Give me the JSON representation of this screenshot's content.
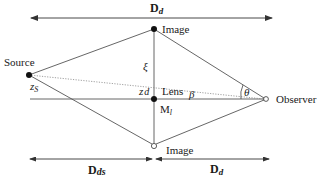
{
  "diagram": {
    "distance_labels": {
      "top": {
        "main": "D",
        "sub": "d"
      },
      "bottom_left": {
        "main": "D",
        "sub": "ds"
      },
      "bottom_right": {
        "main": "D",
        "sub": "d"
      }
    },
    "nodes": {
      "source": {
        "label": "Source",
        "x": 29,
        "y": 75
      },
      "image_top": {
        "label": "Image",
        "x": 154,
        "y": 29
      },
      "lens": {
        "label": "Lens",
        "x": 154,
        "y": 99
      },
      "image_bottom": {
        "label": "Image",
        "x": 154,
        "y": 146
      },
      "observer": {
        "label": "Observer",
        "x": 266,
        "y": 99
      }
    },
    "symbols": {
      "xi": "ξ",
      "z_s": {
        "main": "z",
        "sub": "S"
      },
      "z_d": {
        "main": "z",
        "sub": "d"
      },
      "lens_mass": {
        "main": "M",
        "sub": "l"
      },
      "beta": "β",
      "theta": "θ"
    }
  }
}
